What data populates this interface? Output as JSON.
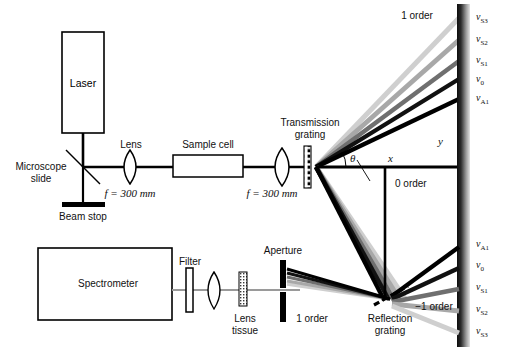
{
  "diagram": {
    "components": {
      "laser": "Laser",
      "lens1": "Lens",
      "lens1_focal": "f = 300 mm",
      "sample_cell": "Sample cell",
      "lens2_focal": "f = 300 mm",
      "microscope_slide": "Microscope\nslide",
      "microscope_slide_l1": "Microscope",
      "microscope_slide_l2": "slide",
      "beam_stop": "Beam stop",
      "transmission_grating_l1": "Transmission",
      "transmission_grating_l2": "grating",
      "spectrometer": "Spectrometer",
      "filter": "Filter",
      "lens_tissue_l1": "Lens",
      "lens_tissue_l2": "tissue",
      "aperture": "Aperture",
      "reflection_grating_l1": "Reflection",
      "reflection_grating_l2": "grating"
    },
    "orders": {
      "plus_one_top": "1 order",
      "zero": "0 order",
      "plus_one_bottom": "1 order",
      "minus_one": "−1 order"
    },
    "axes": {
      "x": "x",
      "y": "y",
      "theta": "θ"
    },
    "screen_labels_top": [
      {
        "sym": "ν",
        "sub": "S3"
      },
      {
        "sym": "ν",
        "sub": "S2"
      },
      {
        "sym": "ν",
        "sub": "S1"
      },
      {
        "sym": "ν",
        "sub": "0"
      },
      {
        "sym": "ν",
        "sub": "A1"
      }
    ],
    "screen_labels_bottom": [
      {
        "sym": "ν",
        "sub": "A1"
      },
      {
        "sym": "ν",
        "sub": "0"
      },
      {
        "sym": "ν",
        "sub": "S1"
      },
      {
        "sym": "ν",
        "sub": "S2"
      },
      {
        "sym": "ν",
        "sub": "S3"
      }
    ],
    "beam_grays": [
      "#000000",
      "#1c1c1c",
      "#4a4a4a",
      "#8f8f8f",
      "#c8c8c8"
    ],
    "colors": {
      "stroke": "#000000",
      "background": "#ffffff",
      "beam_light": "#b9b9b9",
      "screen_dark": "#1a1a1a",
      "screen_light": "#d8d8d8"
    }
  }
}
